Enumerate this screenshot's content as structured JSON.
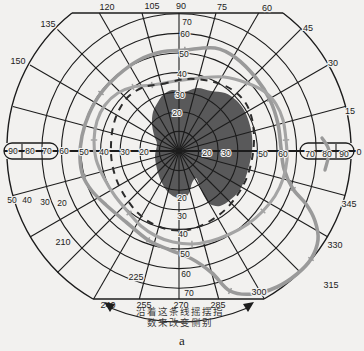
{
  "figure": {
    "caption": "a",
    "annotation": {
      "line1": "沿着这条线摇摆指",
      "line2": "数来改变侧别"
    }
  },
  "chart_data": {
    "type": "line",
    "subtype": "goldmann-perimetry-polar-field",
    "coordinate_system": "screen-pixels 364x351",
    "center": {
      "x": 179,
      "y": 151
    },
    "px_per_10deg": 19.6,
    "rings_deg": [
      10,
      20,
      30,
      40,
      50,
      60,
      70
    ],
    "radial_step_deg": 15,
    "grid_color": "#1c1c1c",
    "paper_color": "#f2f1ef",
    "angle_labels": [
      {
        "t": "120",
        "x": 107,
        "y": 10
      },
      {
        "t": "105",
        "x": 152,
        "y": 9
      },
      {
        "t": "90",
        "x": 181,
        "y": 9
      },
      {
        "t": "75",
        "x": 222,
        "y": 10
      },
      {
        "t": "60",
        "x": 267,
        "y": 11
      },
      {
        "t": "135",
        "x": 48,
        "y": 27
      },
      {
        "t": "45",
        "x": 308,
        "y": 31
      },
      {
        "t": "150",
        "x": 18,
        "y": 64
      },
      {
        "t": "30",
        "x": 333,
        "y": 66
      },
      {
        "t": "15",
        "x": 350,
        "y": 114
      },
      {
        "t": "0",
        "x": 359,
        "y": 155
      },
      {
        "t": "345",
        "x": 349,
        "y": 207
      },
      {
        "t": "330",
        "x": 335,
        "y": 248
      },
      {
        "t": "315",
        "x": 331,
        "y": 288
      },
      {
        "t": "300",
        "x": 259,
        "y": 295
      },
      {
        "t": "285",
        "x": 218,
        "y": 308
      },
      {
        "t": "270",
        "x": 181,
        "y": 308
      },
      {
        "t": "255",
        "x": 144,
        "y": 308
      },
      {
        "t": "240",
        "x": 108,
        "y": 308
      },
      {
        "t": "225",
        "x": 136,
        "y": 280
      },
      {
        "t": "210",
        "x": 63,
        "y": 245
      }
    ],
    "radius_labels": [
      {
        "t": "70",
        "x": 187,
        "y": 25
      },
      {
        "t": "60",
        "x": 185,
        "y": 37
      },
      {
        "t": "50",
        "x": 184,
        "y": 57
      },
      {
        "t": "40",
        "x": 182,
        "y": 77
      },
      {
        "t": "30",
        "x": 180,
        "y": 98
      },
      {
        "t": "20",
        "x": 177,
        "y": 116
      },
      {
        "t": "20",
        "x": 182,
        "y": 201
      },
      {
        "t": "30",
        "x": 182,
        "y": 219
      },
      {
        "t": "40",
        "x": 183,
        "y": 237
      },
      {
        "t": "50",
        "x": 185,
        "y": 257
      },
      {
        "t": "60",
        "x": 186,
        "y": 277
      },
      {
        "t": "70",
        "x": 189,
        "y": 296
      },
      {
        "t": "60",
        "x": 64,
        "y": 154
      },
      {
        "t": "50",
        "x": 84,
        "y": 155
      },
      {
        "t": "40",
        "x": 104,
        "y": 155
      },
      {
        "t": "30",
        "x": 125,
        "y": 155
      },
      {
        "t": "20",
        "x": 144,
        "y": 155
      },
      {
        "t": "20",
        "x": 207,
        "y": 156
      },
      {
        "t": "30",
        "x": 226,
        "y": 156
      },
      {
        "t": "50",
        "x": 263,
        "y": 157
      },
      {
        "t": "60",
        "x": 283,
        "y": 157
      },
      {
        "t": "90",
        "x": 13,
        "y": 154
      },
      {
        "t": "80",
        "x": 30,
        "y": 154
      },
      {
        "t": "70",
        "x": 47,
        "y": 154
      },
      {
        "t": "70",
        "x": 310,
        "y": 157
      },
      {
        "t": "80",
        "x": 327,
        "y": 157
      },
      {
        "t": "90",
        "x": 344,
        "y": 157
      },
      {
        "t": "50",
        "x": 12,
        "y": 203
      },
      {
        "t": "40",
        "x": 27,
        "y": 203
      },
      {
        "t": "30",
        "x": 45,
        "y": 205
      },
      {
        "t": "20",
        "x": 62,
        "y": 206
      }
    ],
    "isopters": [
      {
        "name": "outer-isopter",
        "style": "solid",
        "color": "#9a9a9a",
        "width": 3.6,
        "ticks": true,
        "closed": true,
        "points": [
          [
            185,
            50
          ],
          [
            215,
            48
          ],
          [
            236,
            58
          ],
          [
            256,
            78
          ],
          [
            270,
            100
          ],
          [
            278,
            124
          ],
          [
            281,
            148
          ],
          [
            284,
            169
          ],
          [
            293,
            189
          ],
          [
            306,
            204
          ],
          [
            315,
            221
          ],
          [
            318,
            240
          ],
          [
            311,
            259
          ],
          [
            297,
            274
          ],
          [
            277,
            287
          ],
          [
            253,
            294
          ],
          [
            230,
            291
          ],
          [
            212,
            273
          ],
          [
            192,
            259
          ],
          [
            170,
            250
          ],
          [
            148,
            240
          ],
          [
            126,
            222
          ],
          [
            106,
            205
          ],
          [
            92,
            191
          ],
          [
            83,
            176
          ],
          [
            80,
            158
          ],
          [
            82,
            136
          ],
          [
            89,
            114
          ],
          [
            101,
            93
          ],
          [
            117,
            76
          ],
          [
            139,
            60
          ],
          [
            161,
            52
          ]
        ]
      },
      {
        "name": "middle-isopter",
        "style": "solid",
        "color": "#a4a4a4",
        "width": 3.1,
        "ticks": true,
        "closed": true,
        "points": [
          [
            152,
            85
          ],
          [
            176,
            81
          ],
          [
            200,
            78
          ],
          [
            224,
            77
          ],
          [
            247,
            83
          ],
          [
            265,
            92
          ],
          [
            276,
            104
          ],
          [
            283,
            120
          ],
          [
            286,
            140
          ],
          [
            287,
            160
          ],
          [
            283,
            179
          ],
          [
            275,
            196
          ],
          [
            263,
            211
          ],
          [
            248,
            224
          ],
          [
            230,
            234
          ],
          [
            211,
            241
          ],
          [
            192,
            244
          ],
          [
            173,
            242
          ],
          [
            156,
            236
          ],
          [
            141,
            226
          ],
          [
            129,
            213
          ],
          [
            115,
            196
          ],
          [
            104,
            178
          ],
          [
            96,
            159
          ],
          [
            94,
            140
          ],
          [
            97,
            121
          ],
          [
            105,
            105
          ],
          [
            118,
            93
          ],
          [
            133,
            87
          ]
        ]
      },
      {
        "name": "inner-dashed-isopter",
        "style": "dashed",
        "color": "#2b2b2b",
        "width": 2,
        "ticks": false,
        "closed": true,
        "points": [
          [
            162,
            84
          ],
          [
            186,
            79
          ],
          [
            210,
            81
          ],
          [
            231,
            89
          ],
          [
            245,
            102
          ],
          [
            252,
            119
          ],
          [
            254,
            139
          ],
          [
            252,
            159
          ],
          [
            247,
            177
          ],
          [
            238,
            194
          ],
          [
            226,
            209
          ],
          [
            210,
            221
          ],
          [
            192,
            229
          ],
          [
            172,
            230
          ],
          [
            153,
            224
          ],
          [
            138,
            213
          ],
          [
            126,
            198
          ],
          [
            117,
            181
          ],
          [
            112,
            163
          ],
          [
            111,
            145
          ],
          [
            113,
            127
          ],
          [
            119,
            110
          ],
          [
            129,
            96
          ],
          [
            144,
            87
          ]
        ]
      }
    ],
    "temporal_arc_segment": {
      "color": "#9a9a9a",
      "width": 3.4,
      "points": [
        [
          322,
          138
        ],
        [
          329,
          151
        ],
        [
          325,
          170
        ]
      ]
    },
    "scotoma": {
      "name": "central-scotoma",
      "color": "#59595a",
      "closed": true,
      "points": [
        [
          163,
          95
        ],
        [
          172,
          90
        ],
        [
          184,
          92
        ],
        [
          197,
          88
        ],
        [
          211,
          91
        ],
        [
          225,
          93
        ],
        [
          236,
          100
        ],
        [
          244,
          110
        ],
        [
          249,
          122
        ],
        [
          252,
          136
        ],
        [
          252,
          151
        ],
        [
          249,
          166
        ],
        [
          245,
          179
        ],
        [
          239,
          191
        ],
        [
          230,
          200
        ],
        [
          220,
          206
        ],
        [
          210,
          204
        ],
        [
          204,
          196
        ],
        [
          200,
          187
        ],
        [
          196,
          178
        ],
        [
          192,
          183
        ],
        [
          189,
          193
        ],
        [
          183,
          199
        ],
        [
          175,
          197
        ],
        [
          167,
          191
        ],
        [
          161,
          181
        ],
        [
          157,
          169
        ],
        [
          155,
          156
        ],
        [
          157,
          144
        ],
        [
          154,
          135
        ],
        [
          152,
          124
        ],
        [
          153,
          112
        ],
        [
          158,
          102
        ]
      ]
    },
    "swing_arrow": {
      "from": [
        108,
        307
      ],
      "ctrl": [
        180,
        337
      ],
      "to": [
        250,
        307
      ],
      "color": "#1c1c1c"
    }
  }
}
